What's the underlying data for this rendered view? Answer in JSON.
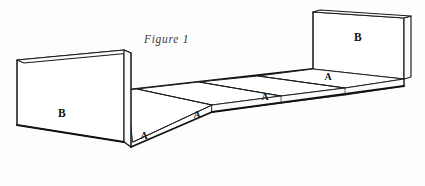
{
  "figure": {
    "caption": "Figure 1",
    "background_color": "#fdfdfc",
    "line_color": "#1a1a1a",
    "labels": {
      "left_panel": "B",
      "right_panel": "B",
      "floor_front_strip": "A",
      "floor_panel_1": "A",
      "floor_panel_2": "A",
      "floor_panel_3": "A"
    },
    "parts": [
      {
        "id": "left-end-panel",
        "label": "B",
        "description": "vertical end panel, near left"
      },
      {
        "id": "right-end-panel",
        "label": "B",
        "description": "vertical end panel, far right"
      },
      {
        "id": "floor-panel-near",
        "label": "A",
        "description": "narrow front facing strip at left"
      },
      {
        "id": "floor-panel-1",
        "label": "A",
        "description": "first horizontal base panel"
      },
      {
        "id": "floor-panel-2",
        "label": "A",
        "description": "second horizontal base panel"
      },
      {
        "id": "floor-panel-3",
        "label": "A",
        "description": "third horizontal base panel"
      }
    ]
  }
}
